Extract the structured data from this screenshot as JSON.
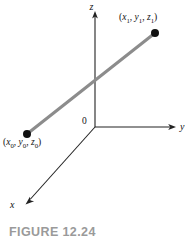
{
  "figure": {
    "caption": "FIGURE 12.24",
    "caption_color": "#9a9a9a",
    "background_color": "#ffffff"
  },
  "diagram": {
    "type": "3d-coordinate-axes-with-line-segment",
    "axes": [
      {
        "name": "z",
        "label": "z",
        "direction": "up",
        "from": [
          95,
          127
        ],
        "to": [
          95,
          14
        ],
        "arrow": true
      },
      {
        "name": "y",
        "label": "y",
        "direction": "right",
        "from": [
          95,
          127
        ],
        "to": [
          176,
          127
        ],
        "arrow": true
      },
      {
        "name": "x",
        "label": "x",
        "direction": "down-left",
        "from": [
          95,
          127
        ],
        "to": [
          26,
          204
        ],
        "arrow": true
      }
    ],
    "origin": {
      "label": "0",
      "x": 95,
      "y": 127
    },
    "axis_color": "#222222",
    "segment": {
      "name": "line-segment",
      "color": "#8c8c8c",
      "width": 3,
      "from": [
        27,
        134
      ],
      "to": [
        155,
        33
      ]
    },
    "points": [
      {
        "name": "point-p0",
        "x": 27,
        "y": 134,
        "radius": 4,
        "color": "#111111",
        "label_parts": {
          "open": "(",
          "v1": "x",
          "s1": "0",
          "sep1": ", ",
          "v2": "y",
          "s2": "0",
          "sep2": ", ",
          "v3": "z",
          "s3": "0",
          "close": ")"
        },
        "label_text": "(x0, y0, z0)"
      },
      {
        "name": "point-p1",
        "x": 155,
        "y": 33,
        "radius": 4,
        "color": "#111111",
        "label_parts": {
          "open": "(",
          "v1": "x",
          "s1": "1",
          "sep1": ", ",
          "v2": "y",
          "s2": "1",
          "sep2": ", ",
          "v3": "z",
          "s3": "1",
          "close": ")"
        },
        "label_text": "(x1, y1, z1)"
      }
    ]
  }
}
